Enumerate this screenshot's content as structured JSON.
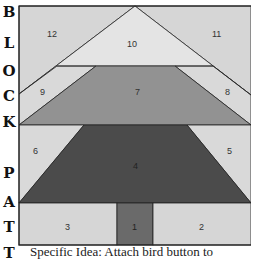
{
  "side_heading": {
    "letters": [
      "B",
      "L",
      "O",
      "C",
      "K",
      "P",
      "A",
      "T",
      "T"
    ]
  },
  "block": {
    "colors": {
      "light": "#d9d9d9",
      "lighter": "#e3e3e3",
      "medium": "#8f8f8f",
      "dark": "#4a4a4a",
      "trunk": "#6b6b6b",
      "outline": "#222222"
    },
    "pieces": [
      {
        "id": "1",
        "label": "1"
      },
      {
        "id": "2",
        "label": "2"
      },
      {
        "id": "3",
        "label": "3"
      },
      {
        "id": "4",
        "label": "4"
      },
      {
        "id": "5",
        "label": "5"
      },
      {
        "id": "6",
        "label": "6"
      },
      {
        "id": "7",
        "label": "7"
      },
      {
        "id": "8",
        "label": "8"
      },
      {
        "id": "9",
        "label": "9"
      },
      {
        "id": "10",
        "label": "10"
      },
      {
        "id": "11",
        "label": "11"
      },
      {
        "id": "12",
        "label": "12"
      }
    ]
  },
  "caption": {
    "text": "Specific Idea: Attach bird button to"
  }
}
